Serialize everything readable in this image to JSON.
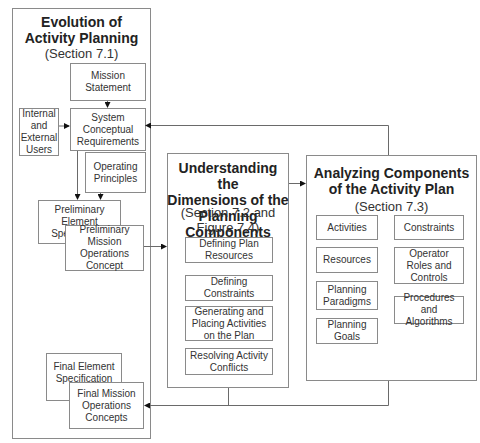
{
  "left_panel": {
    "title": "Evolution of\nActivity Planning",
    "subtitle": "(Section 7.1)",
    "boxes": {
      "mission_statement": "Mission\nStatement",
      "internal_external_users": "Internal\nand\nExternal\nUsers",
      "system_conceptual_requirements": "System\nConceptual\nRequirements",
      "operating_principles": "Operating\nPrinciples",
      "preliminary_element_spec": "Preliminary Element\nSpecification",
      "preliminary_mission_ops": "Preliminary\nMission Operations\nConcept",
      "final_element_spec": "Final Element\nSpecification",
      "final_mission_ops": "Final Mission\nOperations\nConcepts"
    }
  },
  "middle_panel": {
    "title": "Understanding the\nDimensions of the\nPlanning Components",
    "subtitle": "(Section 7.2 and\nFigure 7.4)",
    "items": [
      "Defining Plan\nResources",
      "Defining Constraints",
      "Generating and\nPlacing Activities\non the Plan",
      "Resolving Activity\nConflicts"
    ]
  },
  "right_panel": {
    "title": "Analyzing Components\nof the Activity Plan",
    "subtitle": "(Section 7.3)",
    "left_items": [
      "Activities",
      "Resources",
      "Planning\nParadigms",
      "Planning\nGoals"
    ],
    "right_items": [
      "Constraints",
      "Operator\nRoles and\nControls",
      "Procedures and\nAlgorithms"
    ]
  },
  "colors": {
    "line": "#6a6a6a",
    "border": "#8a8a8a",
    "arrow": "#111111"
  }
}
